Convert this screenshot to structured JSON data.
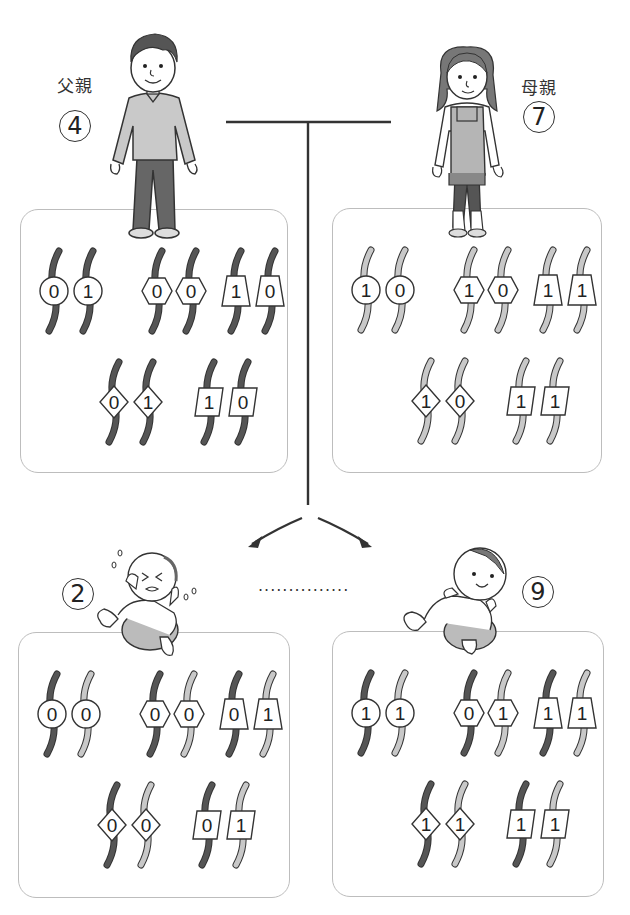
{
  "colors": {
    "father_strand": "#555555",
    "mother_strand": "#c8c8c8",
    "outline": "#333333",
    "panel_border": "#bdbdbd"
  },
  "parents": {
    "father": {
      "label": "父親",
      "number": "4",
      "icon": "father-figure-icon"
    },
    "mother": {
      "label": "母親",
      "number": "7",
      "icon": "mother-figure-icon"
    }
  },
  "children": {
    "child_a": {
      "number": "2",
      "icon": "crying-baby-icon"
    },
    "child_b": {
      "number": "9",
      "icon": "smiling-baby-icon"
    },
    "ellipsis": "..............."
  },
  "panels": {
    "father": {
      "pairs": [
        {
          "shape": "circle",
          "left": {
            "value": "0",
            "strand": "father"
          },
          "right": {
            "value": "1",
            "strand": "father"
          }
        },
        {
          "shape": "hexagon",
          "left": {
            "value": "0",
            "strand": "father"
          },
          "right": {
            "value": "0",
            "strand": "father"
          }
        },
        {
          "shape": "trapezoid",
          "left": {
            "value": "1",
            "strand": "father"
          },
          "right": {
            "value": "0",
            "strand": "father"
          }
        },
        {
          "shape": "diamond",
          "left": {
            "value": "0",
            "strand": "father"
          },
          "right": {
            "value": "1",
            "strand": "father"
          }
        },
        {
          "shape": "parallelogram",
          "left": {
            "value": "1",
            "strand": "father"
          },
          "right": {
            "value": "0",
            "strand": "father"
          }
        }
      ]
    },
    "mother": {
      "pairs": [
        {
          "shape": "circle",
          "left": {
            "value": "1",
            "strand": "mother"
          },
          "right": {
            "value": "0",
            "strand": "mother"
          }
        },
        {
          "shape": "hexagon",
          "left": {
            "value": "1",
            "strand": "mother"
          },
          "right": {
            "value": "0",
            "strand": "mother"
          }
        },
        {
          "shape": "trapezoid",
          "left": {
            "value": "1",
            "strand": "mother"
          },
          "right": {
            "value": "1",
            "strand": "mother"
          }
        },
        {
          "shape": "diamond",
          "left": {
            "value": "1",
            "strand": "mother"
          },
          "right": {
            "value": "0",
            "strand": "mother"
          }
        },
        {
          "shape": "parallelogram",
          "left": {
            "value": "1",
            "strand": "mother"
          },
          "right": {
            "value": "1",
            "strand": "mother"
          }
        }
      ]
    },
    "child_a": {
      "pairs": [
        {
          "shape": "circle",
          "left": {
            "value": "0",
            "strand": "father"
          },
          "right": {
            "value": "0",
            "strand": "mother"
          }
        },
        {
          "shape": "hexagon",
          "left": {
            "value": "0",
            "strand": "father"
          },
          "right": {
            "value": "0",
            "strand": "mother"
          }
        },
        {
          "shape": "trapezoid",
          "left": {
            "value": "0",
            "strand": "father"
          },
          "right": {
            "value": "1",
            "strand": "mother"
          }
        },
        {
          "shape": "diamond",
          "left": {
            "value": "0",
            "strand": "father"
          },
          "right": {
            "value": "0",
            "strand": "mother"
          }
        },
        {
          "shape": "parallelogram",
          "left": {
            "value": "0",
            "strand": "father"
          },
          "right": {
            "value": "1",
            "strand": "mother"
          }
        }
      ]
    },
    "child_b": {
      "pairs": [
        {
          "shape": "circle",
          "left": {
            "value": "1",
            "strand": "father"
          },
          "right": {
            "value": "1",
            "strand": "mother"
          }
        },
        {
          "shape": "hexagon",
          "left": {
            "value": "0",
            "strand": "father"
          },
          "right": {
            "value": "1",
            "strand": "mother"
          }
        },
        {
          "shape": "trapezoid",
          "left": {
            "value": "1",
            "strand": "father"
          },
          "right": {
            "value": "1",
            "strand": "mother"
          }
        },
        {
          "shape": "diamond",
          "left": {
            "value": "1",
            "strand": "father"
          },
          "right": {
            "value": "1",
            "strand": "mother"
          }
        },
        {
          "shape": "parallelogram",
          "left": {
            "value": "1",
            "strand": "father"
          },
          "right": {
            "value": "1",
            "strand": "mother"
          }
        }
      ]
    }
  }
}
